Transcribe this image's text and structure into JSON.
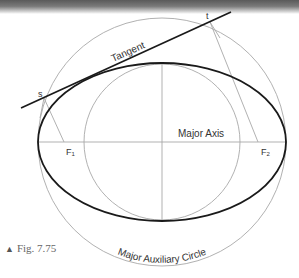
{
  "figure": {
    "caption_marker": "▲",
    "caption": "Fig. 7.75"
  },
  "labels": {
    "tangent": "Tangent",
    "major_axis": "Major Axis",
    "major_auxiliary_circle": "Major Auxiliary Circle",
    "point_s": "s",
    "point_t": "t",
    "focus_1": "F",
    "focus_1_sub": "1",
    "focus_2": "F",
    "focus_2_sub": "2"
  },
  "colors": {
    "ellipse": "#1a1a1a",
    "tangent": "#1a1a1a",
    "construction": "#a8a8a8",
    "text": "#333333"
  }
}
